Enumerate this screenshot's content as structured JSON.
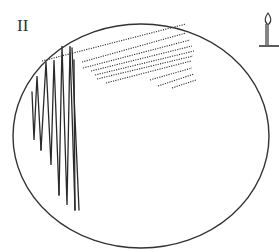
{
  "figure": {
    "panel_label": "II",
    "icons": {
      "burner": "bunsen-burner-icon"
    },
    "colors": {
      "outline": "#333333",
      "streak": "#2a2a2a",
      "background": "#ffffff"
    },
    "dish": {
      "cx": 141,
      "cy": 136,
      "rx": 128,
      "ry": 112
    },
    "vertical_streaks": [
      {
        "x_top": 32,
        "y_top": 92,
        "x_bot": 36,
        "y_bot": 140
      },
      {
        "x_top": 37,
        "y_top": 76,
        "x_bot": 41,
        "y_bot": 150
      },
      {
        "x_top": 46,
        "y_top": 62,
        "x_bot": 51,
        "y_bot": 165
      },
      {
        "x_top": 54,
        "y_top": 60,
        "x_bot": 59,
        "y_bot": 195
      },
      {
        "x_top": 62,
        "y_top": 46,
        "x_bot": 67,
        "y_bot": 205
      },
      {
        "x_top": 70,
        "y_top": 46,
        "x_bot": 75,
        "y_bot": 210
      },
      {
        "x_top": 74,
        "y_top": 60,
        "x_bot": 80,
        "y_bot": 210
      }
    ],
    "dotted_streaks": [
      {
        "x1": 42,
        "y1": 61,
        "x2": 186,
        "y2": 24
      },
      {
        "x1": 82,
        "y1": 62,
        "x2": 186,
        "y2": 33
      },
      {
        "x1": 83,
        "y1": 68,
        "x2": 192,
        "y2": 41
      },
      {
        "x1": 94,
        "y1": 72,
        "x2": 194,
        "y2": 48
      },
      {
        "x1": 95,
        "y1": 78,
        "x2": 194,
        "y2": 55
      },
      {
        "x1": 106,
        "y1": 82,
        "x2": 192,
        "y2": 63
      },
      {
        "x1": 150,
        "y1": 85,
        "x2": 192,
        "y2": 72
      },
      {
        "x1": 172,
        "y1": 87,
        "x2": 195,
        "y2": 80
      }
    ]
  }
}
